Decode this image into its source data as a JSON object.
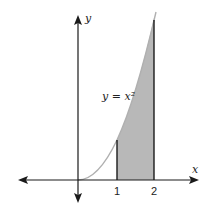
{
  "figure": {
    "function_label": "y = x²",
    "x_axis_label": "x",
    "y_axis_label": "y",
    "x_ticks": [
      "1",
      "2"
    ],
    "shaded_interval": [
      1,
      2
    ],
    "curve": "y = x^2",
    "colors": {
      "axes": "#1a1a1a",
      "curve": "#b0b0b0",
      "shade": "#b8b8b8",
      "bounds": "#1a1a1a"
    }
  }
}
